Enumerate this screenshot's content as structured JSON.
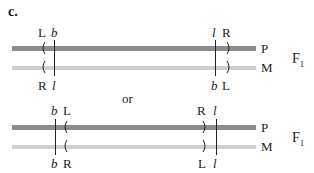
{
  "panel_label": "c.",
  "separator": "or",
  "colors": {
    "paternal_bar": "#8c8c8c",
    "maternal_bar": "#cfcfcf",
    "ink": "#222222"
  },
  "option_1": {
    "top_left_labels": [
      "L",
      "b"
    ],
    "top_right_labels": [
      "l",
      "R"
    ],
    "bottom_left_labels": [
      "R",
      "l"
    ],
    "bottom_right_labels": [
      "b",
      "L"
    ],
    "bar_labels": [
      "P",
      "M"
    ],
    "generation": "F",
    "generation_sub": "1"
  },
  "option_2": {
    "top_left_labels": [
      "b",
      "L"
    ],
    "top_right_labels": [
      "R",
      "l"
    ],
    "bottom_left_labels": [
      "b",
      "R"
    ],
    "bottom_right_labels": [
      "L",
      "l"
    ],
    "bar_labels": [
      "P",
      "M"
    ],
    "generation": "F",
    "generation_sub": "1"
  }
}
